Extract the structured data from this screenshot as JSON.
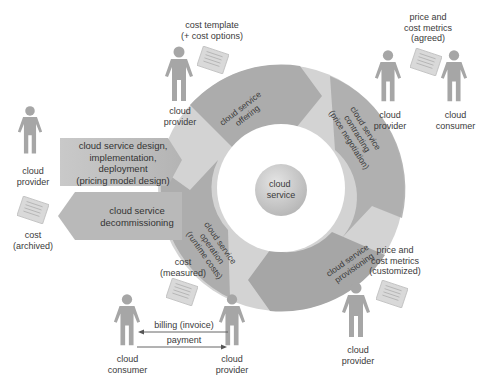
{
  "diagram": {
    "title": "",
    "colors": {
      "ring_light": "#cfcfcf",
      "ring_dark": "#a9a9a9",
      "box_fill": "#bdbdbd",
      "person": "#a6a6a6",
      "document": "#d6d6d6",
      "center": "#c4c4c4",
      "text": "#333333",
      "arrow": "#555555"
    },
    "center": {
      "label_line1": "cloud",
      "label_line2": "service"
    },
    "ring_stages": [
      {
        "id": "offering",
        "lines": [
          "cloud service",
          "offering"
        ]
      },
      {
        "id": "contracting",
        "lines": [
          "cloud service",
          "contracting",
          "(price negotiation)"
        ]
      },
      {
        "id": "provisioning",
        "lines": [
          "cloud service",
          "provisioning"
        ]
      },
      {
        "id": "operation",
        "lines": [
          "cloud service",
          "operation",
          "(runtime costs)"
        ]
      }
    ],
    "side_boxes": [
      {
        "id": "design",
        "lines": [
          "cloud service design,",
          "implementation,",
          "deployment",
          "(pricing model design)"
        ],
        "direction": "right"
      },
      {
        "id": "decommissioning",
        "lines": [
          "cloud service",
          "decommissioning"
        ],
        "direction": "left"
      }
    ],
    "actors": [
      {
        "id": "provider-top",
        "role_lines": [
          "cloud",
          "provider"
        ]
      },
      {
        "id": "provider-left",
        "role_lines": [
          "cloud",
          "provider"
        ]
      },
      {
        "id": "provider-topright",
        "role_lines": [
          "cloud",
          "provider"
        ]
      },
      {
        "id": "consumer-topright",
        "role_lines": [
          "cloud",
          "consumer"
        ]
      },
      {
        "id": "provider-bottomright",
        "role_lines": [
          "cloud",
          "provider"
        ]
      },
      {
        "id": "consumer-bottom",
        "role_lines": [
          "cloud",
          "consumer"
        ]
      },
      {
        "id": "provider-bottom",
        "role_lines": [
          "cloud",
          "provider"
        ]
      }
    ],
    "documents": [
      {
        "id": "cost-template",
        "lines": [
          "cost template",
          "(+ cost options)"
        ]
      },
      {
        "id": "price-agreed",
        "lines": [
          "price and",
          "cost metrics",
          "(agreed)"
        ]
      },
      {
        "id": "cost-archived",
        "lines": [
          "cost",
          "(archived)"
        ]
      },
      {
        "id": "cost-measured",
        "lines": [
          "cost",
          "(measured)"
        ]
      },
      {
        "id": "price-customized",
        "lines": [
          "price and",
          "cost metrics",
          "(customized)"
        ]
      }
    ],
    "flows": [
      {
        "id": "billing",
        "label": "billing (invoice)",
        "from": "cloud provider",
        "to": "cloud consumer"
      },
      {
        "id": "payment",
        "label": "payment",
        "from": "cloud consumer",
        "to": "cloud provider"
      }
    ]
  }
}
